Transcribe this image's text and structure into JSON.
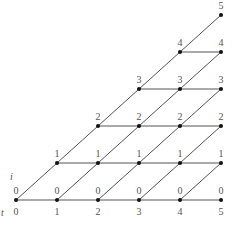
{
  "diagram": {
    "type": "lattice",
    "axis_labels": {
      "time": "t",
      "state": "i"
    },
    "time_ticks": [
      "0",
      "1",
      "2",
      "3",
      "4",
      "5"
    ],
    "layout": {
      "x_of_t": [
        16,
        57,
        98,
        139,
        180,
        221
      ],
      "y_of_i": [
        200,
        163,
        126,
        89,
        52,
        15
      ],
      "tick_y": 215,
      "label_offset_y": -6
    },
    "nodes": [
      {
        "t": 0,
        "i": 0,
        "label": "0"
      },
      {
        "t": 1,
        "i": 0,
        "label": "0"
      },
      {
        "t": 1,
        "i": 1,
        "label": "1"
      },
      {
        "t": 2,
        "i": 0,
        "label": "0"
      },
      {
        "t": 2,
        "i": 1,
        "label": "1"
      },
      {
        "t": 2,
        "i": 2,
        "label": "2"
      },
      {
        "t": 3,
        "i": 0,
        "label": "0"
      },
      {
        "t": 3,
        "i": 1,
        "label": "1"
      },
      {
        "t": 3,
        "i": 2,
        "label": "2"
      },
      {
        "t": 3,
        "i": 3,
        "label": "3"
      },
      {
        "t": 4,
        "i": 0,
        "label": "0"
      },
      {
        "t": 4,
        "i": 1,
        "label": "1"
      },
      {
        "t": 4,
        "i": 2,
        "label": "2"
      },
      {
        "t": 4,
        "i": 3,
        "label": "3"
      },
      {
        "t": 4,
        "i": 4,
        "label": "4"
      },
      {
        "t": 5,
        "i": 0,
        "label": "0"
      },
      {
        "t": 5,
        "i": 1,
        "label": "1"
      },
      {
        "t": 5,
        "i": 2,
        "label": "2"
      },
      {
        "t": 5,
        "i": 3,
        "label": "3"
      },
      {
        "t": 5,
        "i": 4,
        "label": "4"
      },
      {
        "t": 5,
        "i": 5,
        "label": "5"
      }
    ],
    "edge_rule": "from (t,i) to (t+1,i) and (t+1,i+1)",
    "colors": {
      "edge": "#555555",
      "node": "#111111",
      "text": "#555555"
    }
  }
}
